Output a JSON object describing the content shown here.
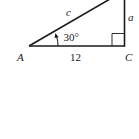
{
  "diagram": {
    "type": "right-triangle",
    "vertices": {
      "A": {
        "label": "A"
      },
      "C": {
        "label": "C"
      }
    },
    "sides": {
      "hypotenuse": {
        "label": "c"
      },
      "opposite": {
        "label": "a"
      },
      "adjacent": {
        "label": "12"
      }
    },
    "angle": {
      "label": "30°",
      "at": "A"
    },
    "right_angle_at": "C",
    "colors": {
      "stroke": "#1a1a1a",
      "background": "#ffffff"
    }
  }
}
